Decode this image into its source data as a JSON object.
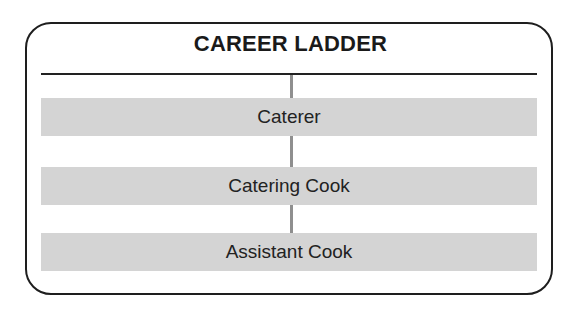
{
  "title": "CAREER LADDER",
  "ladder": {
    "steps": [
      {
        "label": "Caterer",
        "level": 3
      },
      {
        "label": "Catering Cook",
        "level": 2
      },
      {
        "label": "Assistant Cook",
        "level": 1
      }
    ]
  },
  "colors": {
    "border": "#1e1e1e",
    "bar_fill": "#d4d4d4",
    "connector": "#8f8f8f"
  }
}
